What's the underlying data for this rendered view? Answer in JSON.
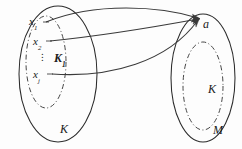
{
  "figure": {
    "background_color": "#fdfdfd",
    "stroke_color": "#2b2b2b",
    "left_set": {
      "outer_label": "K",
      "inner_label": "K",
      "inner_label_subscript": "1",
      "elements": [
        {
          "base": "x",
          "sub": "1"
        },
        {
          "base": "x",
          "sub": "2"
        },
        {
          "base": "x",
          "sub": "j"
        }
      ],
      "ellipsis": "⋮"
    },
    "right_set": {
      "outer_label": "M",
      "inner_label": "K",
      "point_label": "a"
    },
    "arrows": {
      "count": 3,
      "target": "a",
      "sources": [
        "x1",
        "x2",
        "xj"
      ]
    }
  }
}
